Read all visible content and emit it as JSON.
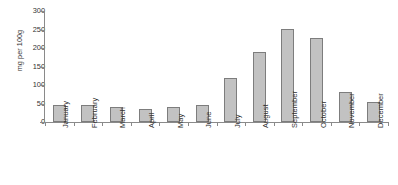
{
  "chart_data": {
    "type": "bar",
    "title": "",
    "xlabel": "",
    "ylabel": "mg per 100g",
    "ylim": [
      0,
      300
    ],
    "yticks": [
      0,
      50,
      100,
      150,
      200,
      250,
      300
    ],
    "ytick_labels": [
      "0",
      "50",
      "100",
      "150",
      "200",
      "250",
      "300"
    ],
    "grid": false,
    "legend": "none",
    "bar_fill_color": "#c2c2c2",
    "bar_edge_color": "#7d7d7d",
    "axis_color": "#8a8a8a",
    "categories": [
      "January",
      "February",
      "March",
      "April",
      "May",
      "June",
      "July",
      "August",
      "September",
      "October",
      "November",
      "December"
    ],
    "values": [
      45,
      47,
      40,
      35,
      40,
      45,
      120,
      190,
      252,
      228,
      82,
      55
    ]
  },
  "caption": {
    "sliver_text": ""
  }
}
